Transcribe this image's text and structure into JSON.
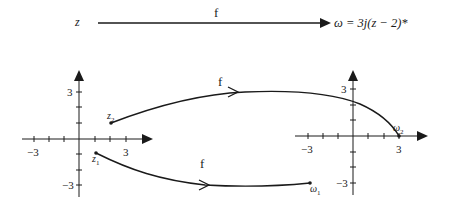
{
  "header": {
    "domain_label": "z",
    "map_label": "f",
    "mapping_equation": "ω = 3j(z − 2)*"
  },
  "z_plane": {
    "x_ticks": {
      "neg": "−3",
      "pos": "3"
    },
    "y_ticks": {
      "pos": "3",
      "neg": "−3"
    },
    "points": {
      "z1": {
        "base": "z",
        "sub": "1"
      },
      "z2": {
        "base": "z",
        "sub": "2"
      }
    }
  },
  "w_plane": {
    "x_ticks": {
      "neg": "−3",
      "pos": "3"
    },
    "y_ticks": {
      "pos": "3",
      "neg": "−3"
    },
    "points": {
      "w1": {
        "base": "ω",
        "sub": "1"
      },
      "w2": {
        "base": "ω",
        "sub": "2"
      }
    }
  },
  "mappings": {
    "upper_label": "f",
    "lower_label": "f"
  },
  "colors": {
    "ink": "#1a1a1a",
    "background": "#ffffff"
  }
}
